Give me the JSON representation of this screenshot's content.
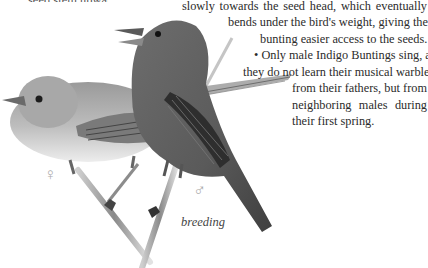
{
  "page": {
    "topic": "Indigo Bunting",
    "cutoff_line": "seed stem upwards",
    "text_lines": [
      "slowly towards the seed head, which eventually",
      "bends under the bird's weight, giving the",
      "bunting easier access to the seeds.",
      "• Only male Indigo Buntings sing, and",
      "they do not learn their musical warble",
      "from their fathers, but from",
      "neighboring males during",
      "their first spring."
    ]
  },
  "illustration": {
    "caption": "breeding",
    "female_symbol": "♀",
    "male_symbol": "♂",
    "subjects": [
      "female-indigo-bunting",
      "male-indigo-bunting-singing"
    ]
  }
}
